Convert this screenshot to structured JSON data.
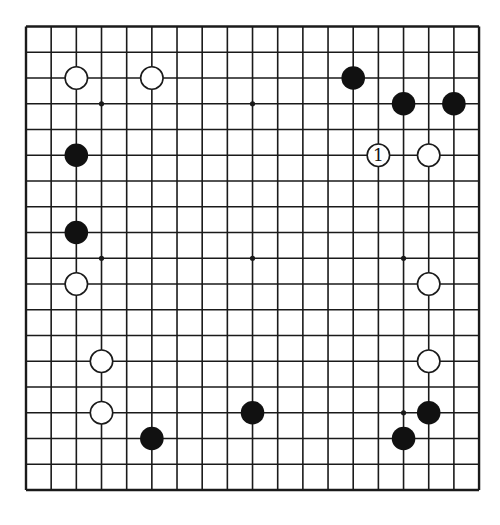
{
  "board": {
    "size": 19,
    "colors": {
      "background": "#ffffff",
      "line": "#1a1a1a",
      "black_stone": "#111111",
      "white_stone": "#ffffff",
      "white_stroke": "#1a1a1a"
    },
    "geometry": {
      "x0": 26,
      "y0": 26.5,
      "dx": 25.17,
      "dy": 25.75,
      "stone_radius": 11.8
    },
    "hoshi": [
      [
        3,
        3
      ],
      [
        9,
        3
      ],
      [
        15,
        3
      ],
      [
        3,
        9
      ],
      [
        9,
        9
      ],
      [
        15,
        9
      ],
      [
        3,
        15
      ],
      [
        9,
        15
      ],
      [
        15,
        15
      ]
    ],
    "stones": [
      {
        "color": "white",
        "col": 2,
        "row": 2
      },
      {
        "color": "white",
        "col": 5,
        "row": 2
      },
      {
        "color": "black",
        "col": 13,
        "row": 2
      },
      {
        "color": "black",
        "col": 15,
        "row": 3
      },
      {
        "color": "black",
        "col": 17,
        "row": 3
      },
      {
        "color": "black",
        "col": 2,
        "row": 5
      },
      {
        "color": "white",
        "col": 14,
        "row": 5,
        "label": "1"
      },
      {
        "color": "white",
        "col": 16,
        "row": 5
      },
      {
        "color": "black",
        "col": 2,
        "row": 8
      },
      {
        "color": "white",
        "col": 2,
        "row": 10
      },
      {
        "color": "white",
        "col": 16,
        "row": 10
      },
      {
        "color": "white",
        "col": 3,
        "row": 13
      },
      {
        "color": "white",
        "col": 16,
        "row": 13
      },
      {
        "color": "white",
        "col": 3,
        "row": 15
      },
      {
        "color": "black",
        "col": 9,
        "row": 15
      },
      {
        "color": "black",
        "col": 16,
        "row": 15
      },
      {
        "color": "black",
        "col": 5,
        "row": 16
      },
      {
        "color": "black",
        "col": 15,
        "row": 16
      }
    ]
  }
}
